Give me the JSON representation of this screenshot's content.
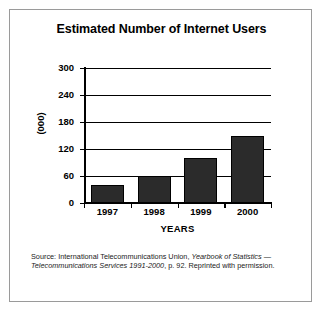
{
  "chart_data": {
    "type": "bar",
    "title": "Estimated Number of Internet Users",
    "xlabel": "YEARS",
    "ylabel": "(000)",
    "categories": [
      "1997",
      "1998",
      "1999",
      "2000"
    ],
    "values": [
      40,
      60,
      100,
      150
    ],
    "ylim": [
      0,
      300
    ],
    "yticks": [
      0,
      60,
      120,
      180,
      240,
      300
    ],
    "ytick_labels": [
      "0",
      "60",
      "120",
      "180",
      "240",
      "300"
    ],
    "grid": true,
    "legend": false,
    "bar_color": "#2b2b2b",
    "axis_color": "#000000",
    "background": "#ffffff",
    "annotations": []
  },
  "source": {
    "prefix": "Source: International Telecommunications Union, ",
    "italic_one": "Yearbook of Statistics",
    "middle": " ",
    "dash": "— ",
    "italic_two": "Telecommunications Services 1991-2000",
    "suffix": ", p. 92. Reprinted with permission."
  }
}
